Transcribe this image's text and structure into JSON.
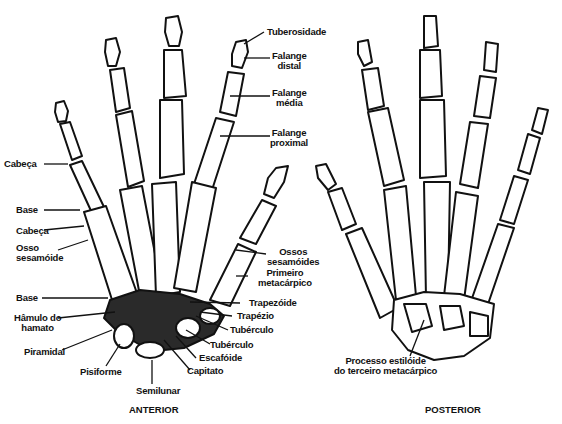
{
  "figure": {
    "views": {
      "anterior": "ANTERIOR",
      "posterior": "POSTERIOR"
    },
    "labels": {
      "tuberosidade": "Tuberosidade",
      "falange_distal": [
        "Falange",
        "distal"
      ],
      "falange_media": [
        "Falange",
        "média"
      ],
      "falange_proximal": [
        "Falange",
        "proximal"
      ],
      "cabeca_1": "Cabeça",
      "base_1": "Base",
      "cabeca_2": "Cabeça",
      "osso_sesamoide": [
        "Osso",
        "sesamóide"
      ],
      "ossos_sesamoides": [
        "Ossos",
        "sesamóides"
      ],
      "primeiro_metacarpico": [
        "Primeiro",
        "metacárpico"
      ],
      "base_2": "Base",
      "hamulo_do_hamato": [
        "Hâmulo do",
        "hamato"
      ],
      "piramidal": "Piramidal",
      "pisiforme": "Pisiforme",
      "semilunar": "Semilunar",
      "capitato": "Capitato",
      "escafoide": "Escafóide",
      "tuberculo_1": "Tubérculo",
      "tuberculo_2": "Tubérculo",
      "trapezio": "Trapézio",
      "trapezoide": "Trapezóide",
      "processo_estiloide": [
        "Processo estilóide",
        "do terceiro metacárpico"
      ]
    },
    "colors": {
      "ink": "#111111",
      "paper": "#ffffff",
      "shade": "#2a2a2a"
    }
  }
}
